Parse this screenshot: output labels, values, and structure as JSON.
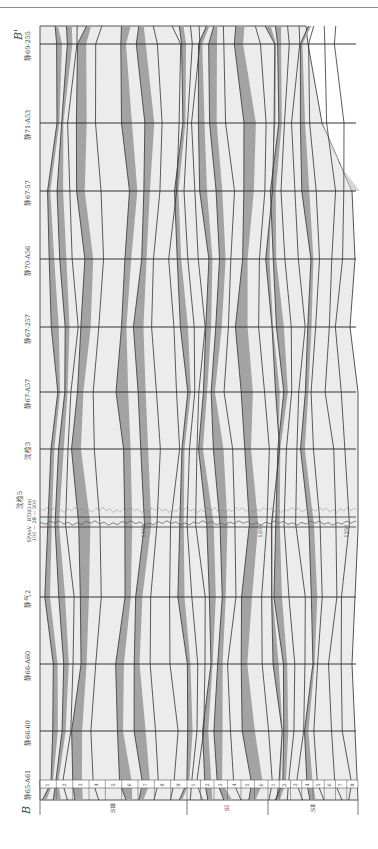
{
  "figure": {
    "section_start_label": "B",
    "section_end_label": "B'",
    "orientation": "rotated 90° counter-clockwise (well lines horizontal)"
  },
  "wells": [
    {
      "name": "静69-255",
      "y": 44
    },
    {
      "name": "静71-A53",
      "y": 123
    },
    {
      "name": "静67-57",
      "y": 191
    },
    {
      "name": "静70-A56",
      "y": 259
    },
    {
      "name": "静67-257",
      "y": 327
    },
    {
      "name": "静67-A57",
      "y": 392
    },
    {
      "name": "沈检3",
      "y": 449
    },
    {
      "name": "沈检5",
      "y": 524
    },
    {
      "name": "静气2",
      "y": 597
    },
    {
      "name": "静66-A60",
      "y": 664
    },
    {
      "name": "静66-60",
      "y": 731
    },
    {
      "name": "静65-A61",
      "y": 783
    }
  ],
  "log_curves": {
    "well": "沈检5",
    "sp_label": "SP/mV",
    "sp_range": "-100 — 20",
    "rt_label": "RT/(Ω·m)",
    "rt_range": "0 — 200",
    "depth_marks": [
      "1150",
      "1200",
      "1250"
    ]
  },
  "formations": [
    {
      "name": "S₁ᵍ₂ Ⅲ",
      "short": "SⅢ",
      "x0": 40,
      "x1": 187,
      "layers": [
        "1",
        "2",
        "3",
        "4",
        "5",
        "6",
        "7",
        "8",
        "9"
      ]
    },
    {
      "name": "S₁ᵍ₂ Ⅰ",
      "short": "SⅠ",
      "x0": 187,
      "x1": 268,
      "layers": [
        "1",
        "2",
        "3",
        "4",
        "5",
        "6"
      ]
    },
    {
      "name": "S₁ᵍ₂ Ⅱ",
      "short": "SⅡ",
      "x0": 268,
      "x1": 358,
      "layers": [
        "1",
        "2",
        "3",
        "4",
        "5",
        "6",
        "7",
        "8"
      ]
    }
  ],
  "colors": {
    "sand": "#a3a3a3",
    "shale": "#e9e9e9",
    "line": "#333333",
    "frame": "#555555"
  }
}
